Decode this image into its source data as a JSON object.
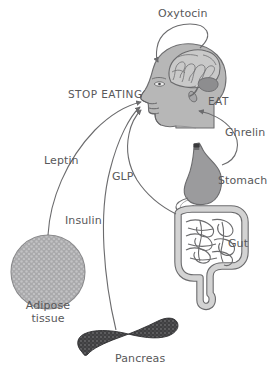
{
  "figure": {
    "background_color": "#ffffff",
    "width": 277,
    "height": 374
  },
  "labels": {
    "oxytocin": "Oxytocin",
    "stop_eating": "STOP EATING",
    "eat": "EAT",
    "ghrelin": "Ghrelin",
    "stomach": "Stomach",
    "gut": "Gut",
    "leptin": "Leptin",
    "glp": "GLP",
    "insulin": "Insulin",
    "adipose_line1": "Adipose",
    "adipose_line2": "tissue",
    "pancreas": "Pancreas"
  },
  "colors": {
    "text": "#58585a",
    "stroke": "#58585a",
    "head_fill": "#b7b7b7",
    "head_stroke": "#6e6e70",
    "brain_fill": "#c9c9c9",
    "brain_stroke": "#6b6b6d",
    "cerebellum_fill": "#8d8d8f",
    "stomach_fill": "#9b9b9d",
    "stomach_stroke": "#6b6b6d",
    "esophagus_tip": "#3a3a3c",
    "gut_fill": "#d3d3d3",
    "gut_stroke": "#6b6b6d",
    "adipose_fill": "#a9a9ab",
    "adipose_stroke": "#8a8a8c",
    "adipose_speckle": "#c2c2c4",
    "pancreas_fill": "#3f3f41",
    "pancreas_speckle": "#6a6a6c",
    "arrow_stroke": "#6b6b6d"
  },
  "organs": [
    {
      "name": "brain",
      "label_key": "oxytocin"
    },
    {
      "name": "head",
      "label_key": null
    },
    {
      "name": "stomach",
      "label_key": "stomach"
    },
    {
      "name": "gut",
      "label_key": "gut"
    },
    {
      "name": "adipose-tissue",
      "label_key": "adipose_line1"
    },
    {
      "name": "pancreas",
      "label_key": "pancreas"
    }
  ],
  "signals": [
    {
      "name": "oxytocin",
      "from": "brain",
      "to": "brain",
      "effect": "stop-eating"
    },
    {
      "name": "ghrelin",
      "from": "stomach",
      "to": "head",
      "effect": "eat"
    },
    {
      "name": "leptin",
      "from": "adipose-tissue",
      "to": "head",
      "effect": "stop-eating"
    },
    {
      "name": "insulin",
      "from": "pancreas",
      "to": "head",
      "effect": "stop-eating"
    },
    {
      "name": "glp",
      "from": "gut",
      "to": "head",
      "effect": "stop-eating"
    }
  ]
}
